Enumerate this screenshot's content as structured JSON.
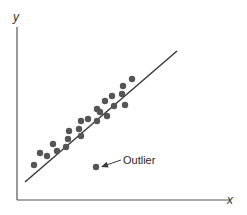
{
  "chart_data": {
    "type": "scatter",
    "title": "",
    "xlabel": "x",
    "ylabel": "y",
    "grid": false,
    "legend": null,
    "ticks": {
      "x": [],
      "y": []
    },
    "series": [
      {
        "name": "observations",
        "points": [
          [
            34,
            165
          ],
          [
            40,
            153
          ],
          [
            47,
            156
          ],
          [
            53,
            144
          ],
          [
            57,
            151
          ],
          [
            66,
            147
          ],
          [
            68,
            139
          ],
          [
            69,
            131
          ],
          [
            79,
            129
          ],
          [
            81,
            136
          ],
          [
            81,
            121
          ],
          [
            88,
            119
          ],
          [
            97,
            109
          ],
          [
            97,
            121
          ],
          [
            100,
            112
          ],
          [
            105,
            101
          ],
          [
            107,
            116
          ],
          [
            112,
            96
          ],
          [
            114,
            106
          ],
          [
            122,
            94
          ],
          [
            125,
            105
          ],
          [
            123,
            86
          ],
          [
            132,
            79
          ]
        ]
      },
      {
        "name": "outlier",
        "points": [
          [
            96,
            167
          ]
        ]
      }
    ],
    "fit_line": {
      "x1": 25,
      "y1": 182,
      "x2": 177,
      "y2": 51
    },
    "annotations": [
      {
        "text": "Outlier",
        "x": 123,
        "y": 164,
        "arrow_from": [
          121,
          160
        ],
        "arrow_to": [
          101,
          167
        ]
      }
    ],
    "axes": {
      "origin": [
        17,
        200
      ],
      "x_end": 230,
      "y_top": 27
    }
  },
  "labels": {
    "x_axis": "x",
    "y_axis": "y",
    "outlier": "Outlier"
  },
  "colors": {
    "ink": "#3a3a3a",
    "dot": "#555555",
    "background": "#ffffff"
  }
}
